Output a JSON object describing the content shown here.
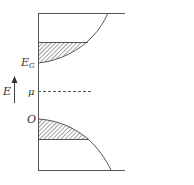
{
  "diagram": {
    "type": "band-diagram",
    "labels": {
      "gap_energy": "E",
      "gap_energy_sub": "G",
      "chemical_potential": "μ",
      "origin": "O",
      "energy_axis": "E"
    },
    "colors": {
      "line": "#555555",
      "hatch": "#444444",
      "text": "#333333",
      "background": "#ffffff"
    }
  }
}
